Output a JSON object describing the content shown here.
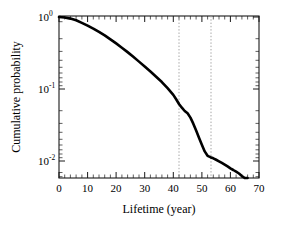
{
  "chart_data": {
    "type": "line",
    "title": "",
    "xlabel": "Lifetime (year)",
    "ylabel": "Cumulative probability",
    "xlim": [
      0,
      70
    ],
    "ylim": [
      0.004,
      1.0
    ],
    "yscale": "log",
    "grid": false,
    "legend": null,
    "xticks": [
      0,
      10,
      20,
      30,
      40,
      50,
      60,
      70
    ],
    "xtick_labels": [
      "0",
      "10",
      "20",
      "30",
      "40",
      "50",
      "60",
      "70"
    ],
    "yticks": [
      1,
      0.1,
      0.01
    ],
    "ytick_labels": [
      "10^0",
      "10^-1",
      "10^-2"
    ],
    "ytick_mantissa": [
      "10",
      "10",
      "10"
    ],
    "ytick_exponent": [
      "0",
      "-1",
      "-2"
    ],
    "series": [
      {
        "name": "cumulative probability",
        "color": "#000000",
        "x": [
          0,
          2,
          4,
          6,
          8,
          10,
          12,
          14,
          16,
          18,
          20,
          22,
          24,
          26,
          28,
          30,
          32,
          34,
          36,
          38,
          40,
          41,
          42,
          43,
          44,
          45,
          46,
          47,
          48,
          49,
          50,
          51,
          52,
          53,
          54,
          55,
          56,
          57,
          58,
          59,
          60,
          61,
          62,
          63,
          64,
          65,
          66
        ],
        "y": [
          1.0,
          0.985,
          0.95,
          0.9,
          0.83,
          0.76,
          0.69,
          0.62,
          0.555,
          0.49,
          0.43,
          0.375,
          0.325,
          0.28,
          0.24,
          0.205,
          0.175,
          0.148,
          0.125,
          0.103,
          0.083,
          0.072,
          0.062,
          0.055,
          0.0495,
          0.046,
          0.04,
          0.033,
          0.0265,
          0.021,
          0.0168,
          0.0136,
          0.0118,
          0.0113,
          0.0109,
          0.0104,
          0.0099,
          0.0094,
          0.0089,
          0.0084,
          0.0079,
          0.0075,
          0.0071,
          0.0067,
          0.0062,
          0.0055,
          0.0046
        ]
      }
    ],
    "annotations": [
      {
        "name": "guide-line-1",
        "type": "vline",
        "x": 42,
        "style": "dotted",
        "color": "#9a9a9a"
      },
      {
        "name": "guide-line-2",
        "type": "vline",
        "x": 53,
        "style": "dotted",
        "color": "#9a9a9a"
      }
    ]
  },
  "axes": {
    "x_title": "Lifetime (year)",
    "y_title": "Cumulative probability"
  }
}
